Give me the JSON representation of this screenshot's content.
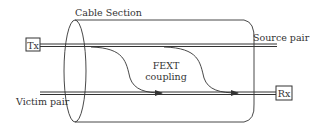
{
  "diagram": {
    "title": "Cable Section",
    "labels": {
      "cable_section": "Cable Section",
      "source_pair": "Source pair",
      "victim_pair": "Victim pair",
      "fext_line1": "FEXT",
      "fext_line2": "coupling",
      "tx": "Tx",
      "rx": "Rx"
    },
    "nodes": [
      {
        "id": "tx",
        "label": "Tx",
        "type": "box"
      },
      {
        "id": "rx",
        "label": "Rx",
        "type": "box"
      }
    ],
    "edges": [
      {
        "from": "tx",
        "to": "source-pair-end",
        "label": "Source pair",
        "type": "double-line"
      },
      {
        "from": "victim-pair-start",
        "to": "rx",
        "label": "Victim pair",
        "type": "double-line"
      },
      {
        "from": "source-pair",
        "to": "victim-pair",
        "label": "FEXT coupling",
        "type": "curved-arrow",
        "count": 2
      }
    ],
    "colors": {
      "stroke": "#333333",
      "background": "#ffffff"
    }
  }
}
